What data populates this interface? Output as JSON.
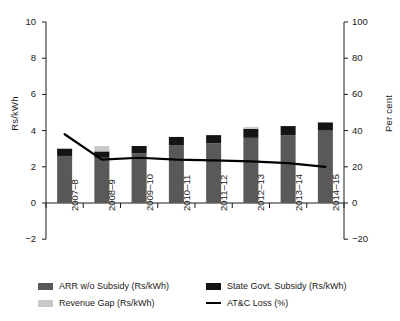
{
  "chart_data": {
    "type": "bar",
    "title": "",
    "subtitle": "",
    "xlabel": "",
    "ylabel": "Rs/kWh",
    "y2label": "Per cent",
    "categories": [
      "2007–8",
      "2008–9",
      "2009–10",
      "2010–11",
      "2011–12",
      "2012–13",
      "2013–14",
      "2014–15"
    ],
    "ylim": [
      -2,
      10
    ],
    "yticks": [
      -2,
      0,
      2,
      4,
      6,
      8,
      10
    ],
    "y2lim": [
      -20,
      100
    ],
    "y2ticks": [
      -20,
      0,
      20,
      40,
      60,
      80,
      100
    ],
    "grid": false,
    "legend_position": "bottom",
    "stacked": true,
    "series": [
      {
        "name": "ARR w/o Subsidy (Rs/kWh)",
        "axis": "left",
        "kind": "bar",
        "color": "#595959",
        "values": [
          2.6,
          2.5,
          2.75,
          3.2,
          3.3,
          3.6,
          3.75,
          4.0
        ]
      },
      {
        "name": "State Govt. Subsidy (Rs/kWh)",
        "axis": "left",
        "kind": "bar",
        "color": "#141414",
        "values": [
          0.4,
          0.35,
          0.4,
          0.45,
          0.45,
          0.5,
          0.5,
          0.45
        ]
      },
      {
        "name": "Revenue Gap (Rs/kWh)",
        "axis": "left",
        "kind": "bar",
        "color": "#c8c8c8",
        "values": [
          0.0,
          0.3,
          0.0,
          0.0,
          0.0,
          0.1,
          0.0,
          0.0
        ]
      },
      {
        "name": "AT&C Loss (%)",
        "axis": "right",
        "kind": "line",
        "color": "#000000",
        "values": [
          38.0,
          24.0,
          25.0,
          24.0,
          23.5,
          23.0,
          22.0,
          20.0
        ]
      }
    ]
  },
  "axes": {
    "left_title": "Rs/kWh",
    "right_title": "Per cent",
    "left_ticks": [
      "10",
      "8",
      "6",
      "4",
      "2",
      "0",
      "−2"
    ],
    "right_ticks": [
      "100",
      "80",
      "60",
      "40",
      "20",
      "0",
      "−20"
    ]
  },
  "legend": {
    "items": [
      {
        "label": "ARR w/o Subsidy (Rs/kWh)",
        "swatch": "#595959",
        "type": "swatch"
      },
      {
        "label": "State Govt. Subsidy (Rs/kWh)",
        "swatch": "#141414",
        "type": "swatch"
      },
      {
        "label": "Revenue Gap (Rs/kWh)",
        "swatch": "#c8c8c8",
        "type": "swatch"
      },
      {
        "label": "AT&C Loss (%)",
        "swatch": "#000000",
        "type": "line"
      }
    ]
  },
  "colors": {
    "arr": "#595959",
    "subsidy": "#141414",
    "revenue_gap": "#c8c8c8",
    "atc_line": "#000000",
    "axis": "#1a1a1a",
    "background": "#ffffff"
  }
}
